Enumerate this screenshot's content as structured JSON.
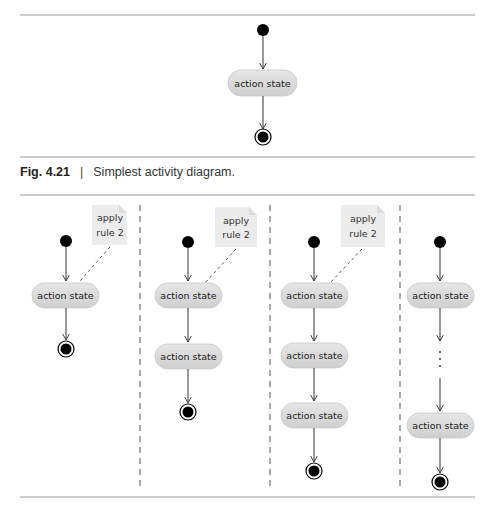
{
  "figure_top": {
    "number": "Fig. 4.21",
    "caption": "Simplest activity diagram.",
    "action_label": "action state"
  },
  "figure_bottom": {
    "note_line1": "apply",
    "note_line2": "rule 2",
    "action_label": "action state",
    "ellipsis": ":",
    "panels": [
      {
        "action_states": 1,
        "has_note": true
      },
      {
        "action_states": 2,
        "has_note": true
      },
      {
        "action_states": 3,
        "has_note": true
      },
      {
        "action_states": 2,
        "has_note": false,
        "has_ellipsis": true
      }
    ]
  },
  "colors": {
    "action_fill": "#d9d9d9",
    "rule": "#9a9a9a",
    "note_fill": "#ececec",
    "node": "#000000"
  }
}
